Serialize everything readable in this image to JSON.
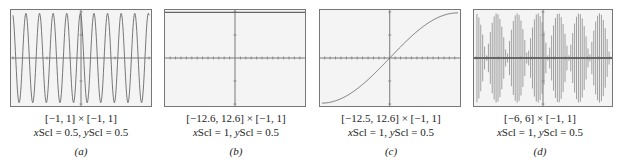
{
  "chart_data": [
    {
      "id": "a",
      "type": "line",
      "title": "",
      "window": "[−1, 1] × [−1, 1]",
      "xlim": [
        -1,
        1
      ],
      "ylim": [
        -1,
        1
      ],
      "xscl": 0.5,
      "yscl": 0.5,
      "xscl_text": "0.5",
      "yscl_text": "0.5",
      "panel_label": "(a)",
      "curve": "oscillation",
      "description": "rapid oscillation, about 10 full cycles across window, amplitude 1",
      "cycles": 10
    },
    {
      "id": "b",
      "type": "line",
      "title": "",
      "window": "[−12.6, 12.6] × [−1, 1]",
      "xlim": [
        -12.6,
        12.6
      ],
      "ylim": [
        -1,
        1
      ],
      "xscl": 1,
      "yscl": 0.5,
      "xscl_text": "1",
      "yscl_text": "0.5",
      "panel_label": "(b)",
      "curve": "constant",
      "description": "horizontal line at y = 1 (top of window)",
      "value": 1
    },
    {
      "id": "c",
      "type": "line",
      "title": "",
      "window": "[−12.5, 12.6] × [−1, 1]",
      "xlim": [
        -12.5,
        12.6
      ],
      "ylim": [
        -1,
        1
      ],
      "xscl": 1,
      "yscl": 0.5,
      "xscl_text": "1",
      "yscl_text": "0.5",
      "panel_label": "(c)",
      "curve": "s-curve",
      "description": "slow rising sine-shaped curve from about −1 at left to about 1 at right, passing through origin"
    },
    {
      "id": "d",
      "type": "line",
      "title": "",
      "window": "[−6, 6] × [−1, 1]",
      "xlim": [
        -6,
        6
      ],
      "ylim": [
        -1,
        1
      ],
      "xscl": 1,
      "yscl": 0.5,
      "xscl_text": "1",
      "yscl_text": "0.5",
      "panel_label": "(d)",
      "curve": "beat",
      "description": "dense vertical-line oscillation with beat envelope, about 6.5 lobes across window",
      "lobes": 6.5
    }
  ],
  "labels": {
    "xscl_prefix": "x",
    "scl": "Scl = ",
    "yscl_prefix": "y",
    "sep": ", "
  }
}
